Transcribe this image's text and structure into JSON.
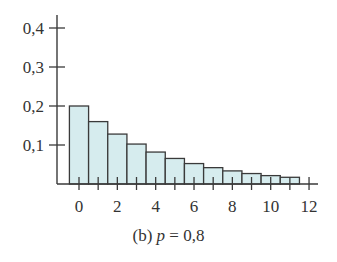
{
  "chart_data": {
    "type": "bar",
    "title": "",
    "caption": {
      "prefix": "(b) ",
      "variable": "p",
      "suffix": " = 0,8"
    },
    "xlabel": "",
    "ylabel": "",
    "x": [
      0,
      1,
      2,
      3,
      4,
      5,
      6,
      7,
      8,
      9,
      10,
      11
    ],
    "values": [
      0.2,
      0.16,
      0.128,
      0.1024,
      0.0819,
      0.0655,
      0.0524,
      0.0419,
      0.0336,
      0.0268,
      0.0215,
      0.0172
    ],
    "xlim": [
      -0.5,
      12.5
    ],
    "ylim": [
      0,
      0.43
    ],
    "x_ticks": [
      0,
      1,
      2,
      3,
      4,
      5,
      6,
      7,
      8,
      9,
      10,
      11,
      12
    ],
    "x_tick_labels": [
      {
        "value": 0,
        "label": "0"
      },
      {
        "value": 2,
        "label": "2"
      },
      {
        "value": 4,
        "label": "4"
      },
      {
        "value": 6,
        "label": "6"
      },
      {
        "value": 8,
        "label": "8"
      },
      {
        "value": 10,
        "label": "10"
      },
      {
        "value": 12,
        "label": "12"
      }
    ],
    "y_ticks": [
      {
        "value": 0.1,
        "label": "0,1"
      },
      {
        "value": 0.2,
        "label": "0,2"
      },
      {
        "value": 0.3,
        "label": "0,3"
      },
      {
        "value": 0.4,
        "label": "0,4"
      }
    ],
    "grid": false,
    "legend": null,
    "colors": {
      "bar_fill": "#d6ecee",
      "bar_stroke": "#3a3a3a",
      "axis": "#3a3a3a",
      "text": "#333333"
    }
  }
}
